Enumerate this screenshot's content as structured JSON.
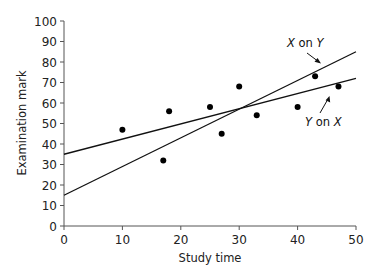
{
  "chart_data": {
    "type": "scatter",
    "title": "",
    "xlabel": "Study time",
    "ylabel": "Examination mark",
    "xlim": [
      0,
      50
    ],
    "ylim": [
      0,
      100
    ],
    "xticks": [
      0,
      10,
      20,
      30,
      40,
      50
    ],
    "yticks": [
      0,
      10,
      20,
      30,
      40,
      50,
      60,
      70,
      80,
      90,
      100
    ],
    "grid": false,
    "legend": null,
    "series": [
      {
        "name": "Observations",
        "kind": "scatter",
        "points": [
          {
            "x": 10,
            "y": 47
          },
          {
            "x": 17,
            "y": 32
          },
          {
            "x": 18,
            "y": 56
          },
          {
            "x": 25,
            "y": 58
          },
          {
            "x": 27,
            "y": 45
          },
          {
            "x": 30,
            "y": 68
          },
          {
            "x": 33,
            "y": 54
          },
          {
            "x": 40,
            "y": 58
          },
          {
            "x": 43,
            "y": 73
          },
          {
            "x": 47,
            "y": 68
          }
        ]
      },
      {
        "name": "Y on X",
        "kind": "line",
        "points": [
          {
            "x": 0,
            "y": 35
          },
          {
            "x": 50,
            "y": 72
          }
        ]
      },
      {
        "name": "X on Y",
        "kind": "line",
        "points": [
          {
            "x": 0,
            "y": 15
          },
          {
            "x": 50,
            "y": 85
          }
        ]
      }
    ],
    "annotations": [
      {
        "text_var": "X",
        "text_mid": " on ",
        "text_var2": "Y",
        "label": "X on Y",
        "points_to": "X on Y"
      },
      {
        "text_var": "Y",
        "text_mid": " on ",
        "text_var2": "X",
        "label": "Y on X",
        "points_to": "Y on X"
      }
    ]
  }
}
